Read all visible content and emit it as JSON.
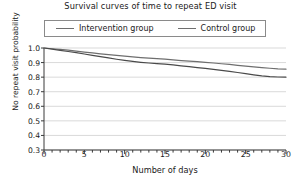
{
  "chart_data": {
    "type": "line",
    "title": "Survival curves of time to repeat ED visit",
    "xlabel": "Number of days",
    "ylabel": "No repeat visit probability",
    "xlim": [
      0,
      30
    ],
    "ylim": [
      0.3,
      1.0
    ],
    "xticks": [
      0,
      5,
      10,
      15,
      20,
      25,
      30
    ],
    "xtick_labels": [
      "0",
      "5",
      "10",
      "15",
      "20",
      "25",
      "30"
    ],
    "x_minor_tick_interval": 1,
    "yticks": [
      0.3,
      0.4,
      0.5,
      0.6,
      0.7,
      0.8,
      0.9,
      1.0
    ],
    "ytick_labels": [
      "0.3",
      "0.4",
      "0.5",
      "0.6",
      "0.7",
      "0.8",
      "0.9",
      "1.0"
    ],
    "grid": "horizontal",
    "legend_position": "top-inside",
    "series": [
      {
        "name": "Intervention group",
        "color": "#6e6e6e",
        "x": [
          0,
          1,
          2,
          3,
          4,
          5,
          6,
          7,
          8,
          9,
          10,
          11,
          12,
          13,
          14,
          15,
          16,
          17,
          18,
          19,
          20,
          21,
          22,
          23,
          24,
          25,
          26,
          27,
          28,
          29,
          30
        ],
        "values": [
          1.0,
          0.995,
          0.99,
          0.985,
          0.978,
          0.972,
          0.966,
          0.96,
          0.954,
          0.949,
          0.944,
          0.939,
          0.934,
          0.93,
          0.927,
          0.923,
          0.919,
          0.914,
          0.91,
          0.906,
          0.902,
          0.897,
          0.892,
          0.887,
          0.881,
          0.876,
          0.871,
          0.866,
          0.861,
          0.857,
          0.855
        ]
      },
      {
        "name": "Control group",
        "color": "#4a4a4a",
        "x": [
          0,
          1,
          2,
          3,
          4,
          5,
          6,
          7,
          8,
          9,
          10,
          11,
          12,
          13,
          14,
          15,
          16,
          17,
          18,
          19,
          20,
          21,
          22,
          23,
          24,
          25,
          26,
          27,
          28,
          29,
          30
        ],
        "values": [
          1.0,
          0.992,
          0.984,
          0.976,
          0.968,
          0.959,
          0.95,
          0.941,
          0.932,
          0.923,
          0.915,
          0.908,
          0.902,
          0.897,
          0.893,
          0.889,
          0.884,
          0.878,
          0.872,
          0.866,
          0.86,
          0.853,
          0.846,
          0.839,
          0.832,
          0.824,
          0.816,
          0.809,
          0.804,
          0.801,
          0.8
        ]
      }
    ]
  },
  "legend": {
    "entries": [
      {
        "label": "Intervention group"
      },
      {
        "label": "Control group"
      }
    ]
  }
}
